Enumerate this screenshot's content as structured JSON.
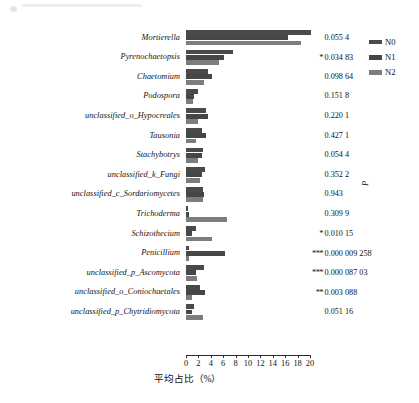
{
  "chart_data": {
    "type": "bar",
    "orientation": "horizontal",
    "title": "",
    "xlabel": "平均占比（%）",
    "ylabel": "",
    "xlim": [
      0,
      21
    ],
    "grid": false,
    "legend_position": "top-right",
    "xticks": [
      0,
      2,
      4,
      6,
      8,
      10,
      12,
      14,
      16,
      18,
      20
    ],
    "categories": [
      "Mortierella",
      "Pyrenochaetopsis",
      "Chaetomium",
      "Podospora",
      "unclassified_o_Hypocreales",
      "Tausonia",
      "Stachybotrys",
      "unclassified_k_Fungi",
      "unclassified_c_Sordariomycetes",
      "Trichoderma",
      "Schizothecium",
      "Penicillium",
      "unclassified_p_Ascomycota",
      "unclassified_o_Coniochaetales",
      "unclassified_p_Chytridiomycota"
    ],
    "series": [
      {
        "name": "N0",
        "color": "#4a4a4a",
        "values": [
          20.2,
          7.5,
          3.6,
          2.0,
          3.2,
          2.6,
          2.8,
          3.1,
          2.8,
          0.35,
          1.6,
          0.55,
          2.9,
          2.3,
          1.3
        ]
      },
      {
        "name": "N1",
        "color": "#464646",
        "values": [
          16.5,
          6.2,
          4.2,
          1.3,
          3.6,
          3.3,
          2.6,
          2.6,
          2.9,
          0.55,
          0.9,
          6.3,
          1.6,
          3.1,
          0.95
        ]
      },
      {
        "name": "N2",
        "color": "#7d7d7d",
        "values": [
          18.6,
          5.4,
          2.9,
          1.1,
          1.9,
          1.6,
          2.0,
          2.2,
          2.7,
          6.6,
          4.2,
          0.45,
          1.8,
          0.9,
          2.8
        ]
      }
    ],
    "pvalues": [
      {
        "stars": "",
        "value": "0.055 4"
      },
      {
        "stars": "*",
        "value": "0.034 83"
      },
      {
        "stars": "",
        "value": "0.098 64"
      },
      {
        "stars": "",
        "value": "0.151 8"
      },
      {
        "stars": "",
        "value": "0.220 1"
      },
      {
        "stars": "",
        "value": "0.427 1"
      },
      {
        "stars": "",
        "value": "0.054 4"
      },
      {
        "stars": "",
        "value": "0.352 2"
      },
      {
        "stars": "",
        "value": "0.943"
      },
      {
        "stars": "",
        "value": "0.309 9"
      },
      {
        "stars": "*",
        "value": "0.010 15"
      },
      {
        "stars": "***",
        "value": "0.000 009 258"
      },
      {
        "stars": "***",
        "value": "0.000 087 03"
      },
      {
        "stars": "**",
        "value": "0.003 088"
      },
      {
        "stars": "",
        "value": "0.051 16"
      }
    ],
    "pvalue_axis_label": "P"
  },
  "legend": {
    "items": [
      {
        "label": "N0",
        "color": "#4a4a4a"
      },
      {
        "label": "N1",
        "color": "#464646"
      },
      {
        "label": "N2",
        "color": "#7d7d7d"
      }
    ]
  },
  "axis": {
    "x_title": "平均占比（%）",
    "tick_labels": [
      "0",
      "2",
      "4",
      "6",
      "8",
      "10",
      "12",
      "14",
      "16",
      "18",
      "20"
    ]
  }
}
